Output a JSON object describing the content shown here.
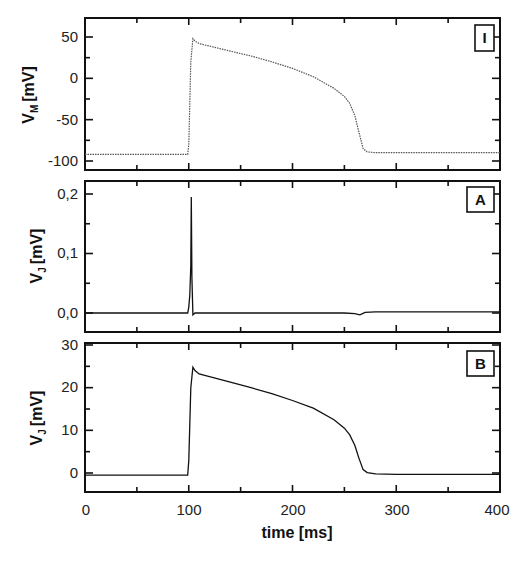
{
  "chart_data": [
    {
      "type": "line",
      "panel_label": "I",
      "title": "",
      "xlabel": "time [ms]",
      "ylabel": "V_M [mV]",
      "ylabel_main": "V",
      "ylabel_sub": "M",
      "ylabel_unit": "[mV]",
      "xlim": [
        0,
        400
      ],
      "ylim": [
        -110,
        65
      ],
      "yticks": [
        50,
        0,
        -50,
        -100
      ],
      "ytick_labels": [
        "50",
        "0",
        "-50",
        "-100"
      ],
      "line_style": "dotted",
      "series": [
        {
          "name": "membrane potential",
          "x": [
            0,
            50,
            99,
            100,
            102,
            104,
            106,
            110,
            120,
            140,
            160,
            180,
            200,
            220,
            240,
            250,
            255,
            260,
            264,
            268,
            272,
            280,
            300,
            350,
            400
          ],
          "y": [
            -92,
            -92,
            -92,
            -80,
            20,
            48,
            45,
            42,
            39,
            33,
            27,
            20,
            12,
            2,
            -12,
            -22,
            -30,
            -45,
            -65,
            -85,
            -89,
            -90,
            -90,
            -90,
            -90
          ]
        }
      ]
    },
    {
      "type": "line",
      "panel_label": "A",
      "title": "",
      "xlabel": "time [ms]",
      "ylabel": "V_J [mV]",
      "ylabel_main": "V",
      "ylabel_sub": "J",
      "ylabel_unit": "[mV]",
      "xlim": [
        0,
        400
      ],
      "ylim": [
        -0.03,
        0.22
      ],
      "yticks": [
        0.2,
        0.1,
        0.0
      ],
      "ytick_labels": [
        "0,2",
        "0,1",
        "0,0"
      ],
      "line_style": "solid",
      "series": [
        {
          "name": "junctional potential A",
          "x": [
            0,
            99,
            100,
            101,
            102,
            102.5,
            103,
            104,
            106,
            150,
            200,
            250,
            260,
            265,
            270,
            280,
            300,
            400
          ],
          "y": [
            0,
            0,
            0.01,
            0.03,
            0.08,
            0.195,
            0.06,
            -0.003,
            0,
            0,
            0,
            0,
            -0.001,
            -0.003,
            0.001,
            0.002,
            0.002,
            0.002
          ]
        }
      ]
    },
    {
      "type": "line",
      "panel_label": "B",
      "title": "",
      "xlabel": "time [ms]",
      "ylabel": "V_J [mV]",
      "ylabel_main": "V",
      "ylabel_sub": "J",
      "ylabel_unit": "[mV]",
      "xlim": [
        0,
        400
      ],
      "ylim": [
        -5,
        30
      ],
      "yticks": [
        30,
        20,
        10,
        0
      ],
      "ytick_labels": [
        "30",
        "20",
        "10",
        "0"
      ],
      "xticks": [
        0,
        100,
        200,
        300,
        400
      ],
      "xtick_labels": [
        "0",
        "100",
        "200",
        "300",
        "400"
      ],
      "line_style": "solid",
      "series": [
        {
          "name": "junctional potential B",
          "x": [
            0,
            50,
            99,
            100,
            102,
            104,
            106,
            110,
            120,
            140,
            160,
            180,
            200,
            220,
            240,
            250,
            255,
            260,
            264,
            268,
            272,
            280,
            300,
            350,
            400
          ],
          "y": [
            -0.5,
            -0.5,
            -0.5,
            3,
            20,
            24.8,
            24,
            23.2,
            22.6,
            21.3,
            20,
            18.6,
            17,
            15.2,
            12.5,
            10.5,
            9,
            6.5,
            3.5,
            0.8,
            0.1,
            -0.2,
            -0.3,
            -0.3,
            -0.3
          ]
        }
      ]
    }
  ],
  "axes": {
    "x_label": "time [ms]",
    "x_tick_labels": [
      "0",
      "100",
      "200",
      "300",
      "400"
    ]
  },
  "panels": [
    {
      "tag": "I",
      "ylabel_main": "V",
      "ylabel_sub": "M",
      "ylabel_unit": "[mV]",
      "ytick_labels": [
        "50",
        "0",
        "-50",
        "-100"
      ]
    },
    {
      "tag": "A",
      "ylabel_main": "V",
      "ylabel_sub": "J",
      "ylabel_unit": "[mV]",
      "ytick_labels": [
        "0,2",
        "0,1",
        "0,0"
      ]
    },
    {
      "tag": "B",
      "ylabel_main": "V",
      "ylabel_sub": "J",
      "ylabel_unit": "[mV]",
      "ytick_labels": [
        "30",
        "20",
        "10",
        "0"
      ]
    }
  ]
}
